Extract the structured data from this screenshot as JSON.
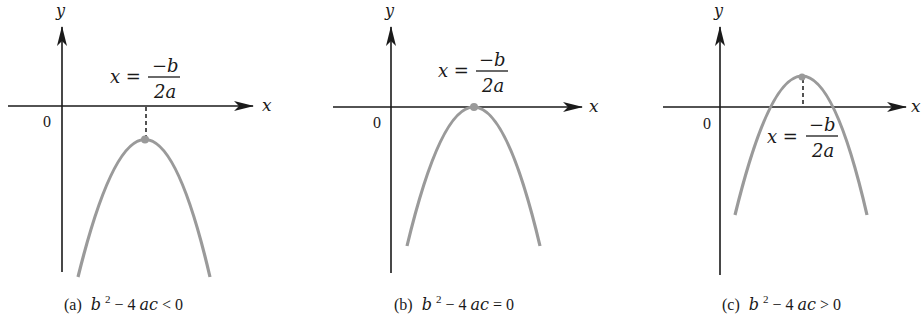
{
  "figure": {
    "panels": [
      {
        "id": "a",
        "caption_prefix": "(a)",
        "caption_expr_b": "b",
        "caption_exp": "2",
        "caption_rest_1": " − 4",
        "caption_rest_ac": "ac",
        "caption_rel": " < 0",
        "axis_x_label": "x",
        "axis_y_label": "y",
        "origin_label": "0",
        "vertex_label_lhs": "x =",
        "vertex_label_num": "−b",
        "vertex_label_den": "2a",
        "description": "Downward parabola entirely below x-axis; no real roots"
      },
      {
        "id": "b",
        "caption_prefix": "(b)",
        "caption_expr_b": "b",
        "caption_exp": "2",
        "caption_rest_1": " − 4",
        "caption_rest_ac": "ac",
        "caption_rel": " = 0",
        "axis_x_label": "x",
        "axis_y_label": "y",
        "origin_label": "0",
        "vertex_label_lhs": "x =",
        "vertex_label_num": "−b",
        "vertex_label_den": "2a",
        "description": "Downward parabola touching x-axis at vertex; one repeated root"
      },
      {
        "id": "c",
        "caption_prefix": "(c)",
        "caption_expr_b": "b",
        "caption_exp": "2",
        "caption_rest_1": " − 4",
        "caption_rest_ac": "ac",
        "caption_rel": " > 0",
        "axis_x_label": "x",
        "axis_y_label": "y",
        "origin_label": "0",
        "vertex_label_lhs": "x =",
        "vertex_label_num": "−b",
        "vertex_label_den": "2a",
        "description": "Downward parabola with vertex above x-axis; two real roots"
      }
    ],
    "colors": {
      "axis": "#1a1a1a",
      "curve": "#9a9a9a",
      "background": "#ffffff"
    }
  }
}
